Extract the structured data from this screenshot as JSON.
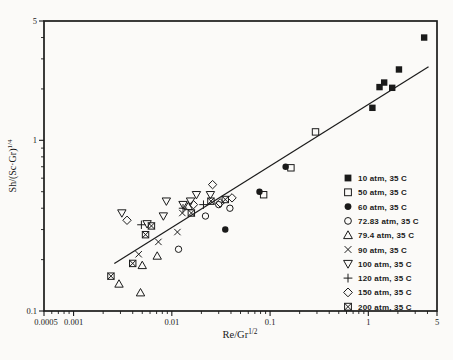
{
  "figure": {
    "background": "#fbfaf8",
    "ink_color": "#1a1a1a"
  },
  "chart_data": {
    "type": "scatter",
    "title": "",
    "xlabel": {
      "base": "Re/Gr",
      "sup": "1/2"
    },
    "ylabel": {
      "base": "Sh/(Sc·Gr)",
      "sup": "1/4"
    },
    "x_scale": "log",
    "y_scale": "log",
    "xlim": [
      0.0005,
      5
    ],
    "ylim": [
      0.1,
      5
    ],
    "x_ticks": [
      {
        "v": 0.0005,
        "label": "0.0005"
      },
      {
        "v": 0.001,
        "label": "0.001"
      },
      {
        "v": 0.01,
        "label": "0.01"
      },
      {
        "v": 0.1,
        "label": "0.1"
      },
      {
        "v": 1,
        "label": "1"
      },
      {
        "v": 5,
        "label": "5"
      }
    ],
    "y_ticks": [
      {
        "v": 0.1,
        "label": "0.1"
      },
      {
        "v": 1,
        "label": "1"
      },
      {
        "v": 5,
        "label": "5"
      }
    ],
    "grid": false,
    "legend_position": "inside-right-bottom",
    "fit_line": {
      "x1": 0.0026,
      "y1": 0.19,
      "x2": 4.1,
      "y2": 2.7
    },
    "series": [
      {
        "name": "10 atm, 35 C",
        "marker": "square-filled",
        "points": [
          [
            3.7,
            4.0
          ],
          [
            2.05,
            2.6
          ],
          [
            1.75,
            2.03
          ],
          [
            1.45,
            2.18
          ],
          [
            1.3,
            2.05
          ],
          [
            1.1,
            1.55
          ]
        ]
      },
      {
        "name": "50 atm, 35 C",
        "marker": "square-open",
        "points": [
          [
            0.29,
            1.12
          ],
          [
            0.163,
            0.69
          ],
          [
            0.086,
            0.48
          ]
        ]
      },
      {
        "name": "60 atm, 35 C",
        "marker": "circle-filled",
        "points": [
          [
            0.144,
            0.7
          ],
          [
            0.078,
            0.5
          ],
          [
            0.035,
            0.3
          ]
        ]
      },
      {
        "name": "72.83 atm, 35 C",
        "marker": "circle-open",
        "points": [
          [
            0.039,
            0.4
          ],
          [
            0.03,
            0.42
          ],
          [
            0.022,
            0.36
          ],
          [
            0.0117,
            0.23
          ]
        ]
      },
      {
        "name": "79.4 atm, 35 C",
        "marker": "triangle-up-open",
        "points": [
          [
            0.0147,
            0.41
          ],
          [
            0.0071,
            0.21
          ],
          [
            0.005,
            0.185
          ],
          [
            0.0048,
            0.128
          ],
          [
            0.0029,
            0.144
          ]
        ]
      },
      {
        "name": "90 atm, 35 C",
        "marker": "x-cross",
        "points": [
          [
            0.0128,
            0.375
          ],
          [
            0.0114,
            0.29
          ],
          [
            0.0073,
            0.254
          ],
          [
            0.0046,
            0.215
          ]
        ]
      },
      {
        "name": "100 atm, 35 C",
        "marker": "triangle-down-open",
        "points": [
          [
            0.0247,
            0.48
          ],
          [
            0.0178,
            0.48
          ],
          [
            0.0155,
            0.44
          ],
          [
            0.013,
            0.42
          ],
          [
            0.0088,
            0.44
          ],
          [
            0.0082,
            0.36
          ],
          [
            0.0056,
            0.324
          ],
          [
            0.0031,
            0.375
          ]
        ]
      },
      {
        "name": "120 atm, 35 C",
        "marker": "plus",
        "points": [
          [
            0.021,
            0.42
          ],
          [
            0.013,
            0.4
          ],
          [
            0.0049,
            0.32
          ]
        ]
      },
      {
        "name": "150 atm, 35 C",
        "marker": "diamond-open",
        "points": [
          [
            0.041,
            0.46
          ],
          [
            0.031,
            0.43
          ],
          [
            0.026,
            0.55
          ],
          [
            0.0166,
            0.42
          ],
          [
            0.0035,
            0.34
          ]
        ]
      },
      {
        "name": "200 atm, 35 C",
        "marker": "square-x",
        "points": [
          [
            0.035,
            0.45
          ],
          [
            0.025,
            0.44
          ],
          [
            0.0158,
            0.375
          ],
          [
            0.0062,
            0.315
          ],
          [
            0.0054,
            0.28
          ],
          [
            0.004,
            0.19
          ],
          [
            0.0024,
            0.16
          ]
        ]
      }
    ]
  }
}
